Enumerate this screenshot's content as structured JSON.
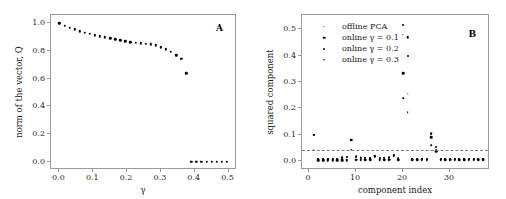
{
  "figure": {
    "width": 506,
    "height": 199,
    "background": "#ffffff",
    "marker_color": "#000000",
    "axis_color": "#9a9a9a",
    "refline_color": "#7d7d7d"
  },
  "panelA": {
    "label": "A",
    "ylabel": "norm of the vector, Q",
    "xlabel": "γ",
    "xticklabels": [
      "0.0",
      "0.1",
      "0.2",
      "0.3",
      "0.4",
      "0.5"
    ],
    "yticklabels": [
      "0.0",
      "0.2",
      "0.4",
      "0.6",
      "0.8",
      "1.0"
    ]
  },
  "panelB": {
    "label": "B",
    "ylabel": "squared component",
    "xlabel": "component index",
    "xticklabels": [
      "0",
      "10",
      "20",
      "30"
    ],
    "yticklabels": [
      "0.0",
      "0.1",
      "0.2",
      "0.3",
      "0.4",
      "0.5"
    ],
    "legend": [
      {
        "label": "offline PCA",
        "size": 1.4
      },
      {
        "label": "online γ = 0.1",
        "size": 2.6
      },
      {
        "label": "online γ = 0.2",
        "size": 2.0
      },
      {
        "label": "online γ = 0.3",
        "size": 1.7
      }
    ],
    "reference_line_value": 0.04
  },
  "chart_data": [
    {
      "type": "scatter",
      "panel": "A",
      "title": "A",
      "xlabel": "γ",
      "ylabel": "norm of the vector, Q",
      "xlim": [
        -0.025,
        0.525
      ],
      "ylim": [
        -0.06,
        1.06
      ],
      "xticks": [
        0.0,
        0.1,
        0.2,
        0.3,
        0.4,
        0.5
      ],
      "yticks": [
        0.0,
        0.2,
        0.4,
        0.6,
        0.8,
        1.0
      ],
      "grid": false,
      "legend": "none",
      "x": [
        0.0,
        0.015,
        0.03,
        0.045,
        0.06,
        0.075,
        0.09,
        0.105,
        0.12,
        0.135,
        0.15,
        0.165,
        0.18,
        0.195,
        0.21,
        0.225,
        0.24,
        0.255,
        0.27,
        0.285,
        0.3,
        0.315,
        0.33,
        0.345,
        0.36,
        0.375,
        0.39,
        0.405,
        0.42,
        0.435,
        0.45,
        0.465,
        0.48,
        0.495
      ],
      "y": [
        1.0,
        0.984,
        0.968,
        0.958,
        0.943,
        0.932,
        0.923,
        0.913,
        0.906,
        0.898,
        0.891,
        0.884,
        0.878,
        0.871,
        0.863,
        0.858,
        0.856,
        0.853,
        0.848,
        0.84,
        0.826,
        0.812,
        0.796,
        0.77,
        0.742,
        0.64,
        0.0,
        0.0,
        0.0,
        0.0,
        0.0,
        0.0,
        0.0,
        0.0
      ]
    },
    {
      "type": "scatter",
      "panel": "B",
      "title": "B",
      "xlabel": "component index",
      "ylabel": "squared component",
      "xlim": [
        -1.5,
        38.5
      ],
      "ylim": [
        -0.035,
        0.555
      ],
      "xticks": [
        0,
        10,
        20,
        30
      ],
      "yticks": [
        0.0,
        0.1,
        0.2,
        0.3,
        0.4,
        0.5
      ],
      "grid": false,
      "legend_position": "upper-left",
      "reference_line": 0.04,
      "categories": [
        1,
        2,
        3,
        4,
        5,
        6,
        7,
        8,
        9,
        10,
        11,
        12,
        13,
        14,
        15,
        16,
        17,
        18,
        19,
        20,
        21,
        22,
        23,
        24,
        25,
        26,
        27,
        28,
        29,
        30,
        31,
        32,
        33,
        34,
        35,
        36,
        37
      ],
      "series": [
        {
          "name": "offline PCA",
          "marker_size": 1.4,
          "values": [
            0.098,
            0.002,
            0.002,
            0.002,
            0.002,
            0.002,
            0.002,
            0.002,
            0.078,
            0.002,
            0.002,
            0.002,
            0.002,
            0.02,
            0.002,
            0.002,
            0.002,
            0.022,
            0.002,
            0.479,
            0.255,
            0.002,
            0.002,
            0.002,
            0.002,
            0.104,
            0.038,
            0.002,
            0.002,
            0.002,
            0.002,
            0.002,
            0.002,
            0.002,
            0.002,
            0.002,
            0.002
          ]
        },
        {
          "name": "online γ = 0.1",
          "marker_size": 2.6,
          "values": [
            0.1,
            0.003,
            0.003,
            0.003,
            0.003,
            0.003,
            0.003,
            0.003,
            0.08,
            0.004,
            0.004,
            0.004,
            0.004,
            0.018,
            0.004,
            0.004,
            0.004,
            0.02,
            0.004,
            0.333,
            0.47,
            0.004,
            0.004,
            0.004,
            0.004,
            0.09,
            0.036,
            0.004,
            0.004,
            0.004,
            0.004,
            0.004,
            0.004,
            0.004,
            0.004,
            0.004,
            0.004
          ]
        },
        {
          "name": "online γ = 0.2",
          "marker_size": 2.0,
          "values": [
            0.097,
            0.005,
            0.005,
            0.005,
            0.005,
            0.005,
            0.012,
            0.014,
            0.078,
            0.016,
            0.012,
            0.01,
            0.009,
            0.018,
            0.01,
            0.01,
            0.012,
            0.022,
            0.008,
            0.517,
            0.398,
            0.006,
            0.006,
            0.006,
            0.006,
            0.102,
            0.052,
            0.006,
            0.006,
            0.006,
            0.006,
            0.006,
            0.006,
            0.006,
            0.006,
            0.006,
            0.006
          ]
        },
        {
          "name": "online γ = 0.3",
          "marker_size": 1.7,
          "values": [
            0.042,
            0.006,
            0.006,
            0.006,
            0.006,
            0.006,
            0.014,
            0.016,
            0.042,
            0.018,
            0.014,
            0.012,
            0.01,
            0.016,
            0.012,
            0.012,
            0.014,
            0.018,
            0.01,
            0.238,
            0.186,
            0.008,
            0.008,
            0.008,
            0.008,
            0.06,
            0.04,
            0.008,
            0.008,
            0.008,
            0.008,
            0.008,
            0.008,
            0.008,
            0.008,
            0.008,
            0.008
          ]
        }
      ]
    }
  ]
}
